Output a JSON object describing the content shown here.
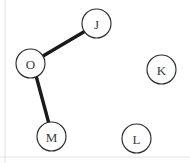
{
  "diagram": {
    "background_color": "#ffffff",
    "node_fill_color": "#ffffff",
    "node_stroke_color": "#2b2b2b",
    "node_label_color": "#3a3a3a",
    "edge_color": "#1a1a1a",
    "node_radius": 14.5,
    "nodes": [
      {
        "id": "J",
        "label": "J",
        "cx": 96.5,
        "cy": 23.5,
        "r": 14.5,
        "connected": true
      },
      {
        "id": "O",
        "label": "O",
        "cx": 30.5,
        "cy": 63.5,
        "r": 14.5,
        "connected": true
      },
      {
        "id": "M",
        "label": "M",
        "cx": 51.5,
        "cy": 136.5,
        "r": 14.5,
        "connected": true
      },
      {
        "id": "K",
        "label": "K",
        "cx": 161.5,
        "cy": 69.5,
        "r": 14.5,
        "connected": false
      },
      {
        "id": "L",
        "label": "L",
        "cx": 136.5,
        "cy": 138.5,
        "r": 14.5,
        "connected": false
      }
    ],
    "edges": [
      {
        "id": "O-J",
        "from": "O",
        "to": "J",
        "x1": 43.0,
        "y1": 56.0,
        "x2": 84.5,
        "y2": 31.5
      },
      {
        "id": "O-M",
        "from": "O",
        "to": "M",
        "x1": 36.5,
        "y1": 77.5,
        "x2": 48.5,
        "y2": 122.0
      }
    ],
    "frame": {
      "left_guide_x": 5,
      "bottom_guide_y": 157
    }
  }
}
